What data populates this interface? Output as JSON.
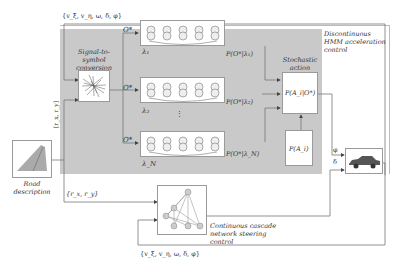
{
  "diagram": {
    "top_state_label": "{v_ξ, v_η, ω, δ, φ}",
    "bottom_state_label": "{v_ξ, v_η, ω, δ, φ}",
    "road_coords_label": "{r_x, r_y}",
    "road_coords_vertical_label": "[r_x, r_y]",
    "hmm_region_title": "Discontinuous HMM acceleration control",
    "signal_block_title": "Signal-to-symbol conversion",
    "stochastic_title": "Stochastic action choice",
    "observation_labels": [
      "O*",
      "O*",
      "O*"
    ],
    "models": [
      {
        "lambda": "λ₁",
        "likelihood": "P(O*|λ₁)"
      },
      {
        "lambda": "λ₂",
        "likelihood": "P(O*|λ₂)"
      },
      {
        "lambda": "λ_N",
        "likelihood": "P(O*|λ_N)"
      }
    ],
    "posterior_label": "P(A_i|O*)",
    "prior_label": "P(A_i)",
    "phi_label": "φ",
    "delta_label": "δ",
    "road_label": "Road description",
    "cascade_label": "Continuous cascade network steering control"
  }
}
